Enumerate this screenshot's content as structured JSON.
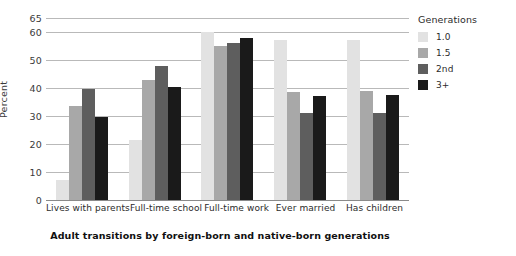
{
  "chart_data": {
    "type": "bar",
    "title": "Adult transitions by foreign-born and native-born generations",
    "xlabel": "",
    "ylabel": "Percent",
    "ylim": [
      0,
      65
    ],
    "yticks": [
      0,
      10,
      20,
      30,
      40,
      50,
      60,
      65
    ],
    "grid": true,
    "legend_title": "Generations",
    "legend_position": "right",
    "categories": [
      "Lives with parents",
      "Full-time school",
      "Full-time work",
      "Ever married",
      "Has children"
    ],
    "series": [
      {
        "name": "1.0",
        "color": "#e2e2e2",
        "values": [
          7,
          21.5,
          60,
          57,
          57
        ]
      },
      {
        "name": "1.5",
        "color": "#a8a8a8",
        "values": [
          33.5,
          43,
          55,
          38.5,
          39
        ]
      },
      {
        "name": "2nd",
        "color": "#5e5e5e",
        "values": [
          39.5,
          48,
          56,
          31,
          31
        ]
      },
      {
        "name": "3+",
        "color": "#1a1a1a",
        "values": [
          29.5,
          40.5,
          58,
          37,
          37.5
        ]
      }
    ]
  }
}
